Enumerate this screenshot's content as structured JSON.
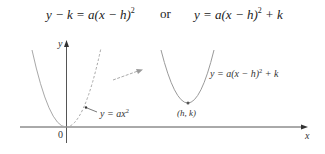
{
  "equations": {
    "left": {
      "prefix": "y − k = a(x − h)",
      "exp": "2",
      "suffix": ""
    },
    "connector": "or",
    "right": {
      "prefix": "y = a(x − h)",
      "exp": "2",
      "suffix": " + k"
    }
  },
  "figure": {
    "axes": {
      "x_label": "x",
      "y_label": "y",
      "origin_label": "0"
    },
    "parabola_original": {
      "label_prefix": "y = ax",
      "label_exp": "2",
      "vertex": "origin"
    },
    "parabola_shifted": {
      "label_prefix": "y = a(x − h)",
      "label_exp": "2",
      "label_suffix": " + k",
      "vertex_label": "(h, k)"
    },
    "shift_arrow": "translation"
  },
  "colors": {
    "axis": "#555555",
    "curve": "#9a9a9a",
    "text": "#333333"
  }
}
